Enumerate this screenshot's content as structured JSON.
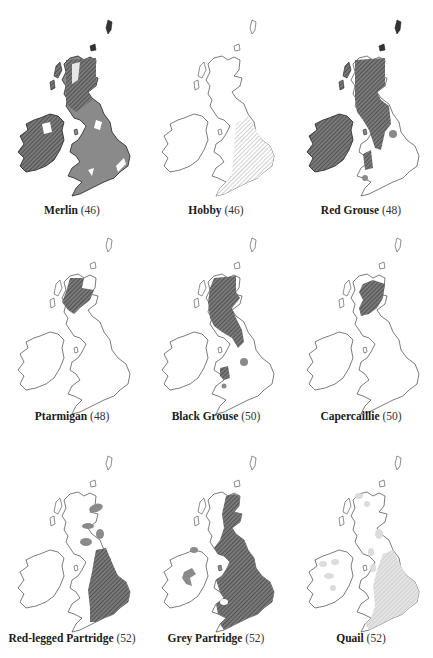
{
  "figure": {
    "panels": [
      {
        "species": "Merlin",
        "number": "(46)",
        "shading": "merlin"
      },
      {
        "species": "Hobby",
        "number": "(46)",
        "shading": "hobby"
      },
      {
        "species": "Red Grouse",
        "number": "(48)",
        "shading": "redgrouse"
      },
      {
        "species": "Ptarmigan",
        "number": "(48)",
        "shading": "ptarmigan"
      },
      {
        "species": "Black Grouse",
        "number": "(50)",
        "shading": "blackgrouse"
      },
      {
        "species": "Capercaillie",
        "number": "(50)",
        "shading": "capercaillie"
      },
      {
        "species": "Red-legged Partridge",
        "number": "(52)",
        "shading": "redlegged"
      },
      {
        "species": "Grey Partridge",
        "number": "(52)",
        "shading": "greypartridge"
      },
      {
        "species": "Quail",
        "number": "(52)",
        "shading": "quail"
      }
    ],
    "colors": {
      "outline": "#444444",
      "dense_fill": "#7a7a7a",
      "light_fill": "#d8d8d8",
      "hatch": "#333333",
      "background": "#ffffff"
    }
  }
}
